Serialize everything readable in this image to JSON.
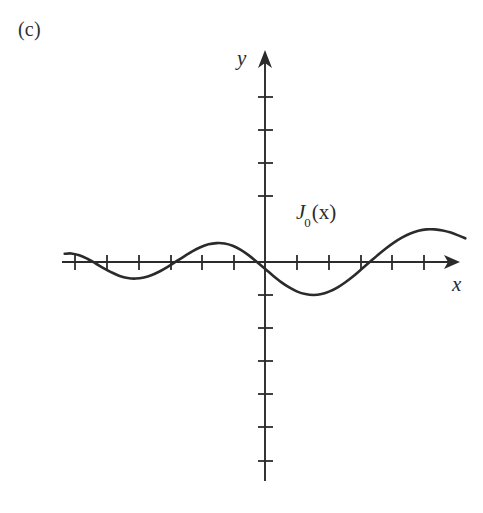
{
  "figure": {
    "panel_label": "(c)",
    "x_axis_label": "x",
    "y_axis_label": "y",
    "curve_label_main": "J",
    "curve_label_sub": "0",
    "curve_label_arg": "(x)",
    "line_color": "#2b2b2b",
    "background_color": "#ffffff"
  },
  "chart_data": {
    "type": "line",
    "title": "(c)",
    "xlabel": "x",
    "ylabel": "y",
    "series": [
      {
        "name": "J_0(x)",
        "label": "J0(x)",
        "x": [
          -12.4,
          -12.0,
          -11.5,
          -11.0,
          -10.5,
          -10.0,
          -9.5,
          -9.0,
          -8.5,
          -8.0,
          -7.5,
          -7.0,
          -6.5,
          -6.0,
          -5.5,
          -5.0,
          -4.5,
          -4.0,
          -3.5,
          -3.0,
          -2.5,
          -2.0,
          -1.5,
          -1.0,
          -0.5,
          0.0,
          0.5,
          1.0,
          1.5,
          2.0,
          2.5,
          3.0,
          3.5,
          4.0,
          4.5,
          5.0,
          5.5,
          6.0,
          6.5,
          7.0,
          7.5,
          8.0,
          8.5,
          9.0,
          9.5,
          10.0,
          10.5,
          11.0,
          11.5,
          12.0,
          12.4
        ],
        "y": [
          0.046,
          0.048,
          0.038,
          0.018,
          -0.007,
          -0.034,
          -0.058,
          -0.078,
          -0.09,
          -0.093,
          -0.087,
          -0.073,
          -0.052,
          -0.026,
          0.003,
          0.032,
          0.06,
          0.083,
          0.099,
          0.106,
          0.104,
          0.091,
          0.068,
          0.037,
          0.0,
          -0.038,
          -0.077,
          -0.113,
          -0.143,
          -0.166,
          -0.18,
          -0.185,
          -0.18,
          -0.165,
          -0.142,
          -0.112,
          -0.077,
          -0.038,
          0.001,
          0.04,
          0.077,
          0.11,
          0.138,
          0.16,
          0.175,
          0.183,
          0.183,
          0.177,
          0.165,
          0.148,
          0.133
        ]
      }
    ],
    "xlim": [
      -6.4,
      6.1
    ],
    "ylim": [
      -6.4,
      6.5
    ],
    "x_tick_values": [
      -6,
      -5,
      -4,
      -3,
      -2,
      -1,
      1,
      2,
      3,
      4,
      5
    ],
    "y_tick_values": [
      5,
      4,
      3,
      2,
      1,
      -1,
      -2,
      -3,
      -4,
      -5,
      -6
    ],
    "grid": false,
    "legend": false,
    "annotations": [
      {
        "text": "J0(x)",
        "x": 1.0,
        "y": 1.85
      }
    ]
  }
}
